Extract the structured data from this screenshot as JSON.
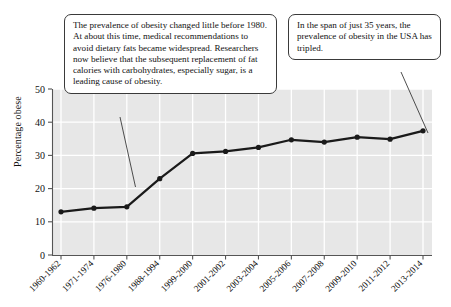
{
  "chart_data": {
    "type": "line",
    "title": "",
    "xlabel": "",
    "ylabel": "Percentage obese",
    "ylim": [
      0,
      50
    ],
    "yticks": [
      0,
      10,
      20,
      30,
      40,
      50
    ],
    "grid": true,
    "legend": "none",
    "plot_background": "#e7e7e7",
    "gridline_color": "#ffffff",
    "series_color": "#1a1a1a",
    "categories": [
      "1960-1962",
      "1971-1974",
      "1976-1980",
      "1988-1994",
      "1999-2000",
      "2001-2002",
      "2003-2004",
      "2005-2006",
      "2007-2008",
      "2009-2010",
      "2011-2012",
      "2013-2014"
    ],
    "values": [
      13.0,
      14.1,
      14.5,
      23.0,
      30.6,
      31.2,
      32.4,
      34.7,
      34.0,
      35.5,
      34.9,
      37.4
    ],
    "series": [
      {
        "name": "Percentage obese",
        "values": [
          13.0,
          14.1,
          14.5,
          23.0,
          30.6,
          31.2,
          32.4,
          34.7,
          34.0,
          35.5,
          34.9,
          37.4
        ]
      }
    ]
  },
  "annotations": {
    "callout_1": {
      "text": "The prevalence of obesity changed little before 1980. At about this time, medical recommendations to avoid dietary fats became widespread. Researchers now believe that the subsequent replacement of fat calories with carbohydrates, especially sugar, is a leading cause of obesity.",
      "points_to_category": "1976-1980"
    },
    "callout_2": {
      "text": "In the span of just 35 years, the prevalence of obesity in the USA has tripled.",
      "points_to_category": "2013-2014"
    }
  },
  "axes": {
    "y_label": "Percentage obese",
    "y_tick_labels": [
      "0",
      "10",
      "20",
      "30",
      "40",
      "50"
    ],
    "x_tick_labels": [
      "1960-1962",
      "1971-1974",
      "1976-1980",
      "1988-1994",
      "1999-2000",
      "2001-2002",
      "2003-2004",
      "2005-2006",
      "2007-2008",
      "2009-2010",
      "2011-2012",
      "2013-2014"
    ]
  }
}
